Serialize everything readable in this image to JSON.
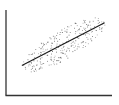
{
  "chart_data": {
    "type": "scatter",
    "title": "",
    "xlabel": "",
    "ylabel": "",
    "grid": false,
    "legend": null,
    "xlim": [
      0,
      100
    ],
    "ylim": [
      0,
      100
    ],
    "trendline": {
      "x": [
        15,
        93
      ],
      "y": [
        35,
        85
      ]
    },
    "colors": {
      "points": "#555555",
      "line": "#1a1a1a",
      "axes": "#333333"
    },
    "point_count": 260,
    "seed": 7
  }
}
